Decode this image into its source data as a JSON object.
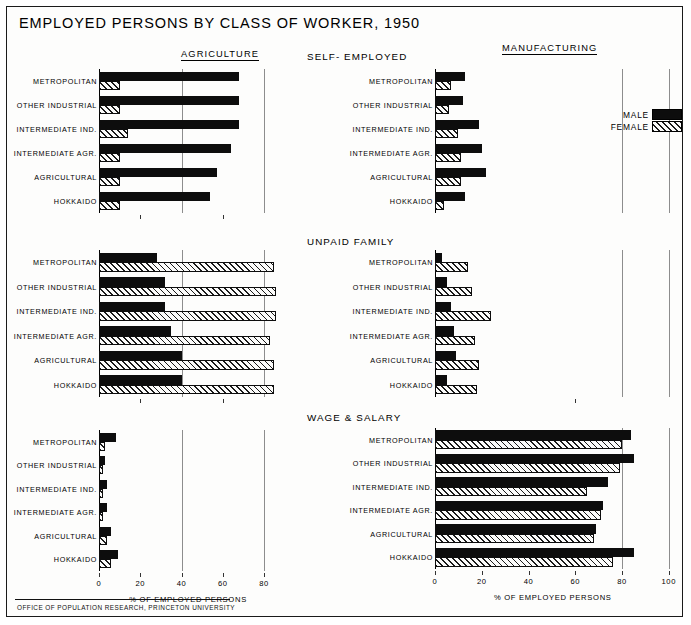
{
  "title": "EMPLOYED PERSONS BY CLASS OF WORKER, 1950",
  "footer": "OFFICE OF POPULATION RESEARCH, PRINCETON UNIVERSITY",
  "columns": {
    "left_header": "AGRICULTURE",
    "right_header": "MANUFACTURING"
  },
  "legend": {
    "male_label": "MALE",
    "female_label": "FEMALE",
    "male_color": "#0d0d0d",
    "female_color": "#ffffff"
  },
  "axis": {
    "caption": "% OF EMPLOYED PERSONS",
    "left_ticks": [
      "0",
      "20",
      "40",
      "60",
      "80"
    ],
    "right_ticks": [
      "0",
      "20",
      "40",
      "60",
      "80",
      "100"
    ],
    "left_range": [
      0,
      90
    ],
    "right_range": [
      0,
      105
    ]
  },
  "regions": [
    "METROPOLITAN",
    "OTHER INDUSTRIAL",
    "INTERMEDIATE IND.",
    "INTERMEDIATE AGR.",
    "AGRICULTURAL",
    "HOKKAIDO"
  ],
  "chart_data": [
    {
      "id": "agriculture-self-employed",
      "type": "bar",
      "title": "",
      "group": "AGRICULTURE",
      "class_of_worker": "SELF-EMPLOYED",
      "orientation": "horizontal",
      "xlabel": "% OF EMPLOYED PERSONS",
      "ylabel": "",
      "xlim": [
        0,
        90
      ],
      "categories": [
        "METROPOLITAN",
        "OTHER INDUSTRIAL",
        "INTERMEDIATE IND.",
        "INTERMEDIATE AGR.",
        "AGRICULTURAL",
        "HOKKAIDO"
      ],
      "series": [
        {
          "name": "MALE",
          "values": [
            68,
            68,
            68,
            64,
            57,
            54
          ]
        },
        {
          "name": "FEMALE",
          "values": [
            10,
            10,
            14,
            10,
            10,
            10
          ]
        }
      ]
    },
    {
      "id": "agriculture-unpaid-family",
      "type": "bar",
      "group": "AGRICULTURE",
      "class_of_worker": "UNPAID FAMILY",
      "orientation": "horizontal",
      "xlabel": "% OF EMPLOYED PERSONS",
      "xlim": [
        0,
        90
      ],
      "categories": [
        "METROPOLITAN",
        "OTHER INDUSTRIAL",
        "INTERMEDIATE IND.",
        "INTERMEDIATE AGR.",
        "AGRICULTURAL",
        "HOKKAIDO"
      ],
      "series": [
        {
          "name": "MALE",
          "values": [
            28,
            32,
            32,
            35,
            40,
            40
          ]
        },
        {
          "name": "FEMALE",
          "values": [
            85,
            86,
            86,
            83,
            85,
            85
          ]
        }
      ]
    },
    {
      "id": "agriculture-wage-salary",
      "type": "bar",
      "group": "AGRICULTURE",
      "class_of_worker": "WAGE & SALARY",
      "orientation": "horizontal",
      "xlabel": "% OF EMPLOYED PERSONS",
      "xlim": [
        0,
        90
      ],
      "categories": [
        "METROPOLITAN",
        "OTHER INDUSTRIAL",
        "INTERMEDIATE IND.",
        "INTERMEDIATE AGR.",
        "AGRICULTURAL",
        "HOKKAIDO"
      ],
      "series": [
        {
          "name": "MALE",
          "values": [
            8,
            3,
            4,
            4,
            6,
            9
          ]
        },
        {
          "name": "FEMALE",
          "values": [
            3,
            2,
            2,
            2,
            4,
            6
          ]
        }
      ]
    },
    {
      "id": "manufacturing-self-employed",
      "type": "bar",
      "group": "MANUFACTURING",
      "class_of_worker": "SELF-EMPLOYED",
      "orientation": "horizontal",
      "xlabel": "% OF EMPLOYED PERSONS",
      "xlim": [
        0,
        105
      ],
      "categories": [
        "METROPOLITAN",
        "OTHER INDUSTRIAL",
        "INTERMEDIATE IND.",
        "INTERMEDIATE AGR.",
        "AGRICULTURAL",
        "HOKKAIDO"
      ],
      "series": [
        {
          "name": "MALE",
          "values": [
            13,
            12,
            19,
            20,
            22,
            13
          ]
        },
        {
          "name": "FEMALE",
          "values": [
            7,
            6,
            10,
            11,
            11,
            4
          ]
        }
      ]
    },
    {
      "id": "manufacturing-unpaid-family",
      "type": "bar",
      "group": "MANUFACTURING",
      "class_of_worker": "UNPAID FAMILY",
      "orientation": "horizontal",
      "xlabel": "% OF EMPLOYED PERSONS",
      "xlim": [
        0,
        105
      ],
      "categories": [
        "METROPOLITAN",
        "OTHER INDUSTRIAL",
        "INTERMEDIATE IND.",
        "INTERMEDIATE AGR.",
        "AGRICULTURAL",
        "HOKKAIDO"
      ],
      "series": [
        {
          "name": "MALE",
          "values": [
            3,
            5,
            7,
            8,
            9,
            5
          ]
        },
        {
          "name": "FEMALE",
          "values": [
            14,
            16,
            24,
            17,
            19,
            18
          ]
        }
      ]
    },
    {
      "id": "manufacturing-wage-salary",
      "type": "bar",
      "group": "MANUFACTURING",
      "class_of_worker": "WAGE & SALARY",
      "orientation": "horizontal",
      "xlabel": "% OF EMPLOYED PERSONS",
      "xlim": [
        0,
        105
      ],
      "categories": [
        "METROPOLITAN",
        "OTHER INDUSTRIAL",
        "INTERMEDIATE IND.",
        "INTERMEDIATE AGR.",
        "AGRICULTURAL",
        "HOKKAIDO"
      ],
      "series": [
        {
          "name": "MALE",
          "values": [
            84,
            85,
            74,
            72,
            69,
            85
          ]
        },
        {
          "name": "FEMALE",
          "values": [
            80,
            79,
            65,
            71,
            68,
            76
          ]
        }
      ]
    }
  ],
  "panel_titles": {
    "self_employed": "SELF- EMPLOYED",
    "unpaid_family": "UNPAID FAMILY",
    "wage_salary": "WAGE & SALARY"
  }
}
